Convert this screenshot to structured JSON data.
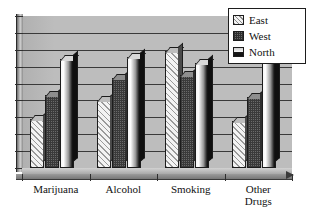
{
  "chart_data": {
    "type": "bar",
    "title": "",
    "subtitle": "",
    "xlabel": "",
    "ylabel": "",
    "categories": [
      "Marijuana",
      "Alcohol",
      "Smoking",
      "Other\nDrugs"
    ],
    "series": [
      {
        "name": "East",
        "values": [
          32,
          45,
          77,
          31
        ]
      },
      {
        "name": "West",
        "values": [
          48,
          59,
          61,
          47
        ]
      },
      {
        "name": "North",
        "values": [
          72,
          73,
          69,
          70
        ]
      }
    ],
    "ylim": [
      0,
      100
    ],
    "yticks": [
      0,
      12.5,
      25,
      37.5,
      50,
      62.5,
      75,
      87.5,
      100
    ],
    "ytick_labels": [],
    "grid": true,
    "gridline_count": 8,
    "legend": {
      "position": "top-right",
      "entries": [
        {
          "label": "East",
          "pattern": "diagonal-stripes"
        },
        {
          "label": "West",
          "pattern": "checkered"
        },
        {
          "label": "North",
          "pattern": "gradient"
        }
      ]
    },
    "style": {
      "three_d": true,
      "plot_background": "#bdbdbd",
      "gridline_color": "#3a3a3a",
      "axis_color": "#2d2d2d",
      "legend_background": "#ffffff",
      "page_background": "#ffffff"
    }
  },
  "legend": {
    "items": [
      {
        "label": "East"
      },
      {
        "label": "West"
      },
      {
        "label": "North"
      }
    ]
  },
  "axis": {
    "categories": [
      {
        "label": "Marijuana"
      },
      {
        "label": "Alcohol"
      },
      {
        "label": "Smoking"
      },
      {
        "label": "Other\nDrugs"
      }
    ]
  }
}
